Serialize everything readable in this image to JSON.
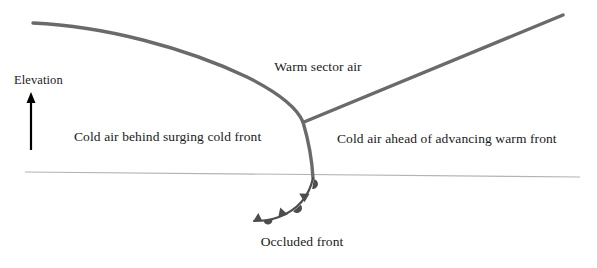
{
  "diagram": {
    "background_color": "#ffffff",
    "axis": {
      "elevation_label": "Elevation",
      "arrow_color": "#000000",
      "arrow_name": "elevation-arrow"
    },
    "labels": {
      "warm_sector_air": "Warm sector air",
      "cold_air_behind": "Cold air behind surging cold front",
      "cold_air_ahead": "Cold air ahead of advancing warm front",
      "occluded_front": "Occluded front"
    },
    "colors": {
      "front_line": "#6a6a6a",
      "ground_line": "#b3b3b3",
      "text": "#1a1a1a",
      "symbol_fill": "#4d4d4d"
    },
    "geometry": {
      "cold_front_curve": "M33,23 C110,27 200,52 258,82 C290,99 299,112 303,122",
      "warm_front_line": "M303,122 L563,15",
      "lower_front_curve": "M303,122 C308,140 312,160 313,178",
      "ground_line": "M25,172 L580,177",
      "occluded_front_curve": "M313,178 C308,196 296,210 278,217 C270,220 262,221 255,221",
      "front_line_width": 3.4,
      "ground_line_width": 1.0
    },
    "occluded_symbols": [
      {
        "type": "semicircle",
        "position": 0.06,
        "name": "warm-front-semicircle"
      },
      {
        "type": "triangle",
        "position": 0.3,
        "name": "cold-front-triangle"
      },
      {
        "type": "semicircle",
        "position": 0.52,
        "name": "warm-front-semicircle"
      },
      {
        "type": "triangle",
        "position": 0.74,
        "name": "cold-front-triangle"
      },
      {
        "type": "semicircle",
        "position": 0.95,
        "name": "warm-front-semicircle"
      }
    ]
  }
}
